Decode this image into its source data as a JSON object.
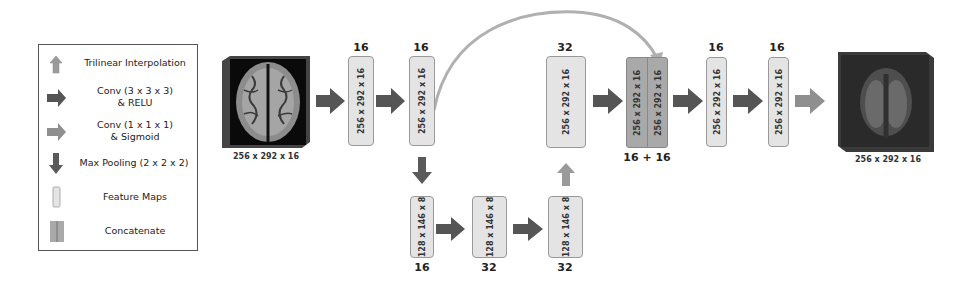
{
  "legend": {
    "items": [
      {
        "icon": "trilinear-interpolation-arrow-icon",
        "label": "Trilinear Interpolation"
      },
      {
        "icon": "conv-relu-arrow-icon",
        "label_line1": "Conv (3 x 3 x 3)",
        "label_line2": "& RELU"
      },
      {
        "icon": "conv-sigmoid-arrow-icon",
        "label_line1": "Conv (1 x 1 x 1)",
        "label_line2": "& Sigmoid"
      },
      {
        "icon": "max-pooling-arrow-icon",
        "label": "Max Pooling (2 x 2 x 2)"
      },
      {
        "icon": "feature-map-icon",
        "label": "Feature Maps"
      },
      {
        "icon": "concatenate-icon",
        "label": "Concatenate"
      }
    ]
  },
  "colors": {
    "conv_relu_arrow": "#555555",
    "sigmoid_arrow": "#8f8f8f",
    "upsample_arrow": "#9a9a9a",
    "pool_arrow": "#5a5a5a",
    "feature_map": "#e4e4e4",
    "concat_map": "#a9a9a9",
    "skip_arc": "#b0b0b0"
  },
  "input_volume": {
    "label": "256 x 292 x 16"
  },
  "output_volume": {
    "label": "256 x 292 x 16"
  },
  "feature_maps": {
    "enc1": {
      "dims": "256 x 292 x 16",
      "channels": "16"
    },
    "enc2": {
      "dims": "256 x 292 x 16",
      "channels": "16"
    },
    "bot1": {
      "dims": "128 x 146 x 8",
      "channels": "16"
    },
    "bot2": {
      "dims": "128 x 146 x 8",
      "channels": "32"
    },
    "bot3": {
      "dims": "128 x 146 x 8",
      "channels": "32"
    },
    "up1": {
      "dims": "256 x 292 x 16",
      "channels": "32"
    },
    "concat_a": {
      "dims": "256 x 292 x 16"
    },
    "concat_b": {
      "dims": "256 x 292 x 16"
    },
    "concat_channels": "16 + 16",
    "dec1": {
      "dims": "256 x 292 x 16",
      "channels": "16"
    },
    "dec2": {
      "dims": "256 x 292 x 16",
      "channels": "16"
    }
  }
}
